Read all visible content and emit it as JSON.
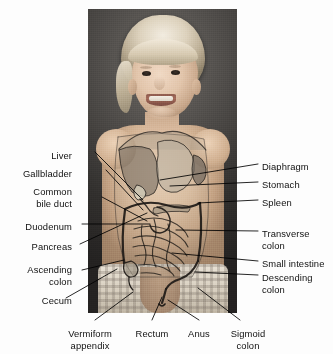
{
  "figure": {
    "type": "anatomical-diagram",
    "background_color": "#fdfdfd",
    "label_color": "#111111",
    "leader_line_color": "#000000"
  },
  "photo": {
    "alt": "photograph of a smiling blonde toddler, bare torso, dark studio backdrop",
    "left": 88,
    "top": 9,
    "width": 149,
    "height": 304
  },
  "labels_left": [
    {
      "id": "liver",
      "lines": [
        "Liver"
      ],
      "x": 72,
      "y": 150
    },
    {
      "id": "gallbladder",
      "lines": [
        "Gallbladder"
      ],
      "x": 72,
      "y": 168
    },
    {
      "id": "common-bile-duct",
      "lines": [
        "Common",
        "bile duct"
      ],
      "x": 72,
      "y": 186
    },
    {
      "id": "duodenum",
      "lines": [
        "Duodenum"
      ],
      "x": 72,
      "y": 221
    },
    {
      "id": "pancreas",
      "lines": [
        "Pancreas"
      ],
      "x": 72,
      "y": 241
    },
    {
      "id": "ascending-colon",
      "lines": [
        "Ascending",
        "colon"
      ],
      "x": 72,
      "y": 264
    },
    {
      "id": "cecum",
      "lines": [
        "Cecum"
      ],
      "x": 72,
      "y": 295
    }
  ],
  "labels_right": [
    {
      "id": "diaphragm",
      "lines": [
        "Diaphragm"
      ],
      "x": 262,
      "y": 161
    },
    {
      "id": "stomach",
      "lines": [
        "Stomach"
      ],
      "x": 262,
      "y": 179
    },
    {
      "id": "spleen",
      "lines": [
        "Spleen"
      ],
      "x": 262,
      "y": 197
    },
    {
      "id": "transverse-colon",
      "lines": [
        "Transverse",
        "colon"
      ],
      "x": 262,
      "y": 228
    },
    {
      "id": "small-intestine",
      "lines": [
        "Small intestine"
      ],
      "x": 262,
      "y": 258
    },
    {
      "id": "descending-colon",
      "lines": [
        "Descending",
        "colon"
      ],
      "x": 262,
      "y": 272
    }
  ],
  "labels_bottom": [
    {
      "id": "vermiform-appendix",
      "lines": [
        "Vermiform",
        "appendix"
      ],
      "x": 90,
      "y": 328
    },
    {
      "id": "rectum",
      "lines": [
        "Rectum"
      ],
      "x": 152,
      "y": 328
    },
    {
      "id": "anus",
      "lines": [
        "Anus"
      ],
      "x": 199,
      "y": 328
    },
    {
      "id": "sigmoid-colon",
      "lines": [
        "Sigmoid",
        "colon"
      ],
      "x": 248,
      "y": 328
    }
  ],
  "organs": [
    {
      "id": "liver",
      "name": "Liver",
      "color": "#8e8378"
    },
    {
      "id": "gallbladder",
      "name": "Gallbladder",
      "color": "#cfc9ae"
    },
    {
      "id": "common-bile-duct",
      "name": "Common bile duct",
      "color": "#d8d2c0"
    },
    {
      "id": "duodenum",
      "name": "Duodenum",
      "color": "#b5ab99"
    },
    {
      "id": "pancreas",
      "name": "Pancreas",
      "color": "#a99e8c"
    },
    {
      "id": "stomach",
      "name": "Stomach",
      "color": "#b2a795"
    },
    {
      "id": "diaphragm",
      "name": "Diaphragm",
      "color": "#9b9183"
    },
    {
      "id": "spleen",
      "name": "Spleen",
      "color": "#8b8176"
    },
    {
      "id": "transverse-colon",
      "name": "Transverse colon",
      "color": "#a79d8c"
    },
    {
      "id": "ascending-colon",
      "name": "Ascending colon",
      "color": "#a79d8c"
    },
    {
      "id": "descending-colon",
      "name": "Descending colon",
      "color": "#a79d8c"
    },
    {
      "id": "sigmoid-colon",
      "name": "Sigmoid colon",
      "color": "#a79d8c"
    },
    {
      "id": "small-intestine",
      "name": "Small intestine",
      "color": "#9e9484"
    },
    {
      "id": "cecum",
      "name": "Cecum",
      "color": "#a79d8c"
    },
    {
      "id": "vermiform-appendix",
      "name": "Vermiform appendix",
      "color": "#8f8576"
    },
    {
      "id": "rectum",
      "name": "Rectum",
      "color": "#998f80"
    },
    {
      "id": "anus",
      "name": "Anus",
      "color": "#8a8072"
    }
  ]
}
